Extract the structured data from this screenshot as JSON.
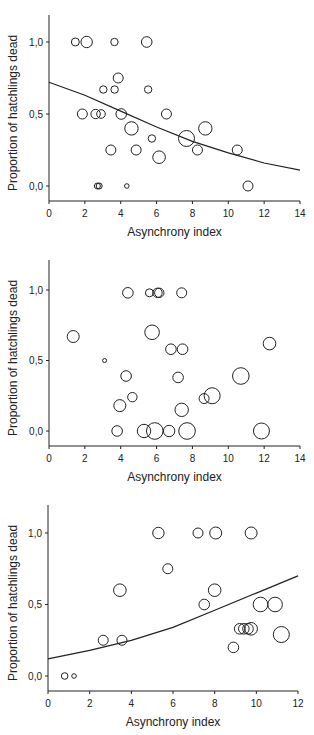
{
  "chart_data": [
    {
      "type": "scatter",
      "title": "",
      "xlabel": "Asynchrony index",
      "ylabel": "Proportion of hatchlings dead",
      "xlim": [
        0,
        14
      ],
      "ylim": [
        -0.1,
        1.2
      ],
      "xticks": [
        "0",
        "2",
        "4",
        "6",
        "8",
        "10",
        "12",
        "14"
      ],
      "yticks": [
        "0,0",
        "0,5",
        "1,0"
      ],
      "grid": false,
      "legend": null,
      "fit_curve": {
        "type": "logistic",
        "x": [
          0,
          2,
          4,
          6,
          8,
          10,
          12,
          14
        ],
        "y": [
          0.72,
          0.63,
          0.52,
          0.41,
          0.31,
          0.23,
          0.16,
          0.11
        ]
      },
      "points": [
        {
          "x": 1.47,
          "y": 1.0,
          "r": 4
        },
        {
          "x": 2.1,
          "y": 1.0,
          "r": 5.7
        },
        {
          "x": 3.65,
          "y": 1.0,
          "r": 3.7
        },
        {
          "x": 5.45,
          "y": 1.0,
          "r": 5.3
        },
        {
          "x": 3.86,
          "y": 0.75,
          "r": 5
        },
        {
          "x": 3.03,
          "y": 0.67,
          "r": 3.7
        },
        {
          "x": 3.66,
          "y": 0.67,
          "r": 3.7
        },
        {
          "x": 5.53,
          "y": 0.67,
          "r": 3.7
        },
        {
          "x": 1.86,
          "y": 0.5,
          "r": 5
        },
        {
          "x": 2.6,
          "y": 0.5,
          "r": 4.7
        },
        {
          "x": 2.9,
          "y": 0.5,
          "r": 4.3
        },
        {
          "x": 4.03,
          "y": 0.5,
          "r": 5.3
        },
        {
          "x": 6.55,
          "y": 0.5,
          "r": 5
        },
        {
          "x": 4.6,
          "y": 0.4,
          "r": 6.7
        },
        {
          "x": 8.72,
          "y": 0.4,
          "r": 6.7
        },
        {
          "x": 5.74,
          "y": 0.33,
          "r": 3.7
        },
        {
          "x": 7.67,
          "y": 0.33,
          "r": 8
        },
        {
          "x": 3.45,
          "y": 0.25,
          "r": 5
        },
        {
          "x": 4.86,
          "y": 0.25,
          "r": 5
        },
        {
          "x": 8.28,
          "y": 0.25,
          "r": 5
        },
        {
          "x": 10.5,
          "y": 0.25,
          "r": 5
        },
        {
          "x": 6.14,
          "y": 0.2,
          "r": 6.3
        },
        {
          "x": 2.7,
          "y": 0.0,
          "r": 3
        },
        {
          "x": 2.8,
          "y": 0.0,
          "r": 3
        },
        {
          "x": 4.34,
          "y": 0.0,
          "r": 2.3
        },
        {
          "x": 11.1,
          "y": 0.0,
          "r": 5
        }
      ]
    },
    {
      "type": "scatter",
      "title": "",
      "xlabel": "Asynchrony index",
      "ylabel": "Proportion of hatchlings dead",
      "xlim": [
        0,
        14
      ],
      "ylim": [
        -0.1,
        1.2
      ],
      "xticks": [
        "0",
        "2",
        "4",
        "6",
        "8",
        "10",
        "12",
        "14"
      ],
      "yticks": [
        "0,0",
        "0,5",
        "1,0"
      ],
      "grid": false,
      "legend": null,
      "fit_curve": null,
      "points": [
        {
          "x": 4.4,
          "y": 0.98,
          "r": 5.3
        },
        {
          "x": 5.6,
          "y": 0.98,
          "r": 4
        },
        {
          "x": 6.05,
          "y": 0.98,
          "r": 4.7
        },
        {
          "x": 6.15,
          "y": 0.98,
          "r": 4.7
        },
        {
          "x": 7.4,
          "y": 0.98,
          "r": 5
        },
        {
          "x": 1.35,
          "y": 0.67,
          "r": 6
        },
        {
          "x": 5.75,
          "y": 0.7,
          "r": 7.3
        },
        {
          "x": 12.3,
          "y": 0.62,
          "r": 6.3
        },
        {
          "x": 6.8,
          "y": 0.58,
          "r": 5.3
        },
        {
          "x": 7.45,
          "y": 0.58,
          "r": 5.3
        },
        {
          "x": 3.1,
          "y": 0.5,
          "r": 2
        },
        {
          "x": 4.3,
          "y": 0.39,
          "r": 5.3
        },
        {
          "x": 7.2,
          "y": 0.38,
          "r": 5.3
        },
        {
          "x": 10.7,
          "y": 0.39,
          "r": 8.3
        },
        {
          "x": 4.65,
          "y": 0.24,
          "r": 4.7
        },
        {
          "x": 8.65,
          "y": 0.23,
          "r": 5
        },
        {
          "x": 9.1,
          "y": 0.25,
          "r": 8
        },
        {
          "x": 3.95,
          "y": 0.18,
          "r": 6
        },
        {
          "x": 7.4,
          "y": 0.15,
          "r": 6.7
        },
        {
          "x": 3.8,
          "y": 0.0,
          "r": 5.3
        },
        {
          "x": 5.3,
          "y": 0.0,
          "r": 6.7
        },
        {
          "x": 5.9,
          "y": 0.0,
          "r": 8.3
        },
        {
          "x": 6.7,
          "y": 0.0,
          "r": 5.7
        },
        {
          "x": 7.7,
          "y": 0.0,
          "r": 8.3
        },
        {
          "x": 11.85,
          "y": 0.0,
          "r": 8
        }
      ]
    },
    {
      "type": "scatter",
      "title": "",
      "xlabel": "Asynchrony index",
      "ylabel": "Proportion of hatchlings dead",
      "xlim": [
        0,
        12
      ],
      "ylim": [
        -0.1,
        1.2
      ],
      "xticks": [
        "0",
        "2",
        "4",
        "6",
        "8",
        "10",
        "12"
      ],
      "yticks": [
        "0,0",
        "0,5",
        "1,0"
      ],
      "grid": false,
      "legend": null,
      "fit_curve": {
        "type": "logistic",
        "x": [
          0,
          2,
          4,
          6,
          8,
          10,
          12
        ],
        "y": [
          0.12,
          0.18,
          0.25,
          0.34,
          0.46,
          0.58,
          0.7
        ]
      },
      "points": [
        {
          "x": 5.3,
          "y": 1.0,
          "r": 5.7
        },
        {
          "x": 7.2,
          "y": 1.0,
          "r": 5
        },
        {
          "x": 8.05,
          "y": 1.0,
          "r": 6
        },
        {
          "x": 9.75,
          "y": 1.0,
          "r": 6
        },
        {
          "x": 5.75,
          "y": 0.75,
          "r": 5
        },
        {
          "x": 3.45,
          "y": 0.6,
          "r": 6.3
        },
        {
          "x": 8.0,
          "y": 0.6,
          "r": 6.3
        },
        {
          "x": 7.5,
          "y": 0.5,
          "r": 5.3
        },
        {
          "x": 10.2,
          "y": 0.5,
          "r": 7.3
        },
        {
          "x": 10.9,
          "y": 0.5,
          "r": 7.3
        },
        {
          "x": 9.2,
          "y": 0.33,
          "r": 5.3
        },
        {
          "x": 9.4,
          "y": 0.33,
          "r": 5.3
        },
        {
          "x": 9.6,
          "y": 0.33,
          "r": 5.3
        },
        {
          "x": 9.75,
          "y": 0.33,
          "r": 6.3
        },
        {
          "x": 11.2,
          "y": 0.29,
          "r": 8
        },
        {
          "x": 2.65,
          "y": 0.25,
          "r": 5
        },
        {
          "x": 3.55,
          "y": 0.25,
          "r": 5
        },
        {
          "x": 8.9,
          "y": 0.2,
          "r": 5.3
        },
        {
          "x": 0.8,
          "y": 0.0,
          "r": 3.3
        },
        {
          "x": 1.25,
          "y": 0.0,
          "r": 2.3
        }
      ]
    }
  ]
}
